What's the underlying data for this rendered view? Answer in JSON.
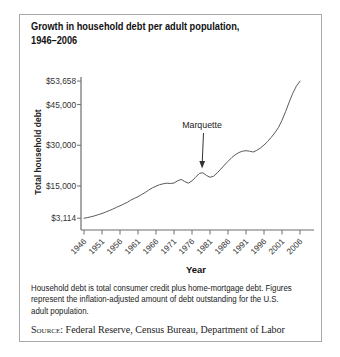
{
  "figure": {
    "title_line1": "Growth in household debt per adult population,",
    "title_line2": "1946–2006",
    "annotation": {
      "label": "Marquette",
      "year": 1978
    },
    "footnote_lines": [
      "Household debt is total consumer credit plus home-mortgage debt. Figures",
      "represent the inflation-adjusted amount of debt outstanding for the U.S.",
      "adult population."
    ],
    "source_prefix": "Source:",
    "source_text": "Federal Reserve, Census Bureau, Department of Labor"
  },
  "y_axis": {
    "label": "Total household debt",
    "ticks": [
      {
        "label": "$53,658",
        "value": 53658
      },
      {
        "label": "$45,000",
        "value": 45000
      },
      {
        "label": "$30,000",
        "value": 30000
      },
      {
        "label": "$15,000",
        "value": 15000
      },
      {
        "label": "$3,114",
        "value": 3114
      }
    ]
  },
  "x_axis": {
    "label": "Year",
    "ticks": [
      1946,
      1951,
      1956,
      1961,
      1966,
      1971,
      1976,
      1981,
      1986,
      1991,
      1996,
      2001,
      2006
    ]
  },
  "chart_data": {
    "type": "line",
    "title": "Growth in household debt per adult population, 1946–2006",
    "xlabel": "Year",
    "ylabel": "Total household debt",
    "xlim": [
      1946,
      2006
    ],
    "ylim": [
      3114,
      53658
    ],
    "grid": false,
    "legend": false,
    "annotations": [
      {
        "text": "Marquette",
        "x": 1978
      }
    ],
    "x": [
      1946,
      1947,
      1948,
      1949,
      1950,
      1951,
      1952,
      1953,
      1954,
      1955,
      1956,
      1957,
      1958,
      1959,
      1960,
      1961,
      1962,
      1963,
      1964,
      1965,
      1966,
      1967,
      1968,
      1969,
      1970,
      1971,
      1972,
      1973,
      1974,
      1975,
      1976,
      1977,
      1978,
      1979,
      1980,
      1981,
      1982,
      1983,
      1984,
      1985,
      1986,
      1987,
      1988,
      1989,
      1990,
      1991,
      1992,
      1993,
      1994,
      1995,
      1996,
      1997,
      1998,
      1999,
      2000,
      2001,
      2002,
      2003,
      2004,
      2005,
      2006
    ],
    "values": [
      3114,
      3350,
      3650,
      4000,
      4450,
      4850,
      5350,
      5900,
      6450,
      7100,
      7700,
      8300,
      8950,
      9800,
      10400,
      11050,
      11800,
      12600,
      13500,
      14300,
      14900,
      15450,
      15800,
      16000,
      15900,
      16100,
      16900,
      17400,
      16600,
      16000,
      16900,
      18200,
      19600,
      19900,
      18900,
      18200,
      18600,
      19800,
      21200,
      22700,
      24100,
      25400,
      26500,
      27300,
      27800,
      28000,
      27800,
      27500,
      28100,
      29000,
      30100,
      31400,
      32900,
      34600,
      36500,
      39200,
      42400,
      45900,
      49200,
      51800,
      53658
    ]
  },
  "colors": {
    "line": "#5a5a5a",
    "axis": "#6e6e6e",
    "tick_text": "#333333",
    "text": "#1c1c1c",
    "border": "#a8a8a8",
    "background": "#ffffff"
  }
}
